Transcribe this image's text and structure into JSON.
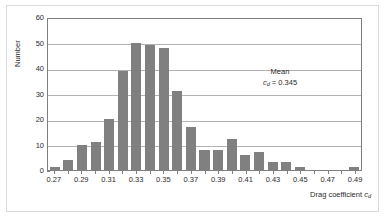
{
  "chart_data": {
    "type": "bar",
    "title": "",
    "subtitle": "",
    "xlabel": "Drag coefficient c_d",
    "xlabel_text": "Drag coefficient",
    "xlabel_symbol": "c",
    "xlabel_subscript": "d",
    "ylabel": "Number",
    "xlim": [
      0.265,
      0.495
    ],
    "ylim": [
      0,
      60
    ],
    "ytick_labels": [
      "0",
      "10",
      "20",
      "30",
      "40",
      "50",
      "60"
    ],
    "ytick_values": [
      0,
      10,
      20,
      30,
      40,
      50,
      60
    ],
    "xtick_labels": [
      "0.27",
      "0.29",
      "0.31",
      "0.33",
      "0.35",
      "0.37",
      "0.39",
      "0.41",
      "0.43",
      "0.45",
      "0.47",
      "0.49"
    ],
    "xtick_values": [
      0.27,
      0.29,
      0.31,
      0.33,
      0.35,
      0.37,
      0.39,
      0.41,
      0.43,
      0.45,
      0.47,
      0.49
    ],
    "grid": true,
    "grid_axis": "y",
    "legend": false,
    "bar_color": "#808080",
    "categories": [
      0.27,
      0.28,
      0.29,
      0.3,
      0.31,
      0.32,
      0.33,
      0.34,
      0.35,
      0.36,
      0.37,
      0.38,
      0.39,
      0.4,
      0.41,
      0.42,
      0.43,
      0.44,
      0.45,
      0.46,
      0.47,
      0.48,
      0.49
    ],
    "values": [
      1,
      4,
      10,
      11,
      20,
      39,
      50,
      49,
      48,
      31,
      17,
      8,
      8,
      12,
      6,
      7,
      3,
      3,
      1,
      0,
      0,
      0,
      1
    ],
    "annotations": [
      {
        "line1": "Mean",
        "symbol": "c",
        "subscript": "d",
        "equals": " = ",
        "value": "0.345",
        "full_text": "Mean c_d = 0.345"
      }
    ]
  },
  "figure": {
    "background": "#ffffff",
    "frame_color": "#d9d9d9",
    "axis_color": "#7f7f7f",
    "gridline_color": "#b3b3b3",
    "text_color": "#2b2b2b"
  }
}
